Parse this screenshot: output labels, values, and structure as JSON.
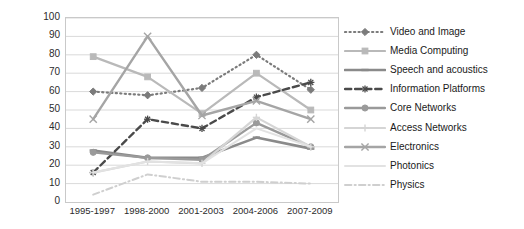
{
  "chart_data": {
    "type": "line",
    "title": "",
    "xlabel": "",
    "ylabel": "Average number of publications",
    "categories": [
      "1995-1997",
      "1998-2000",
      "2001-2003",
      "2004-2006",
      "2007-2009"
    ],
    "ylim": [
      0,
      100
    ],
    "ytick_step": 10,
    "yticks": [
      "100",
      "90",
      "80",
      "70",
      "60",
      "50",
      "40",
      "30",
      "20",
      "10",
      "0"
    ],
    "grid": "horizontal",
    "legend_position": "right",
    "series": [
      {
        "name": "Video and Image",
        "values": [
          60,
          58,
          62,
          80,
          61
        ],
        "color": "#7b7b7b",
        "line_style": "dotted",
        "marker": "diamond",
        "width": 2.2
      },
      {
        "name": "Media Computing",
        "values": [
          79,
          68,
          48,
          70,
          50
        ],
        "color": "#b9b9b9",
        "line_style": "solid",
        "marker": "square",
        "width": 2.2
      },
      {
        "name": "Speech and acoustics",
        "values": [
          28,
          24,
          24,
          35,
          29
        ],
        "color": "#8a8a8a",
        "line_style": "solid",
        "marker": "dash",
        "width": 2.6
      },
      {
        "name": "Information Platforms",
        "values": [
          16,
          45,
          40,
          57,
          65
        ],
        "color": "#4a4a4a",
        "line_style": "dashed",
        "marker": "star",
        "width": 2.4
      },
      {
        "name": "Core Networks",
        "values": [
          27,
          24,
          23,
          43,
          30
        ],
        "color": "#9a9a9a",
        "line_style": "solid",
        "marker": "circle",
        "width": 2.4
      },
      {
        "name": "Access Networks",
        "values": [
          16,
          22,
          21,
          46,
          30
        ],
        "color": "#d5d5d5",
        "line_style": "solid",
        "marker": "plus",
        "width": 2.2
      },
      {
        "name": "Electronics",
        "values": [
          45,
          90,
          47,
          55,
          45
        ],
        "color": "#a5a5a5",
        "line_style": "solid",
        "marker": "x",
        "width": 2.4
      },
      {
        "name": "Photonics",
        "values": [
          16,
          22,
          21,
          40,
          30
        ],
        "color": "#e2e2e2",
        "line_style": "solid",
        "marker": "none",
        "width": 2.0
      },
      {
        "name": "Physics",
        "values": [
          4,
          15,
          11,
          11,
          10
        ],
        "color": "#cfcfcf",
        "line_style": "dashdot",
        "marker": "none",
        "width": 2.0
      }
    ]
  },
  "axes": {
    "y_title": "Average number of publications"
  }
}
